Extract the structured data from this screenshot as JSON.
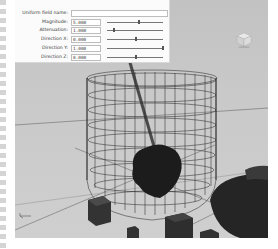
{
  "field_panel": {
    "name_label": "Uniform field name:",
    "name_value": "",
    "rows": [
      {
        "label": "Magnitude:",
        "value": "5.000",
        "slider_pos": 0.55
      },
      {
        "label": "Attenuation:",
        "value": "1.000",
        "slider_pos": 0.1
      },
      {
        "label": "Direction X:",
        "value": "0.000",
        "slider_pos": 0.5
      },
      {
        "label": "Direction Y:",
        "value": "1.000",
        "slider_pos": 0.98
      },
      {
        "label": "Direction Z:",
        "value": "0.000",
        "slider_pos": 0.5
      }
    ]
  },
  "viewport": {
    "background": "#c6c6c6",
    "objects": [
      "wireframe-cylinder-container",
      "diagonal-rod",
      "dark-blob-mesh",
      "small-box-left",
      "small-box-center",
      "small-box-right",
      "dark-bowl-shape"
    ],
    "view_cube": "view-cube-icon",
    "axis_indicator": "axis-indicator-icon"
  }
}
